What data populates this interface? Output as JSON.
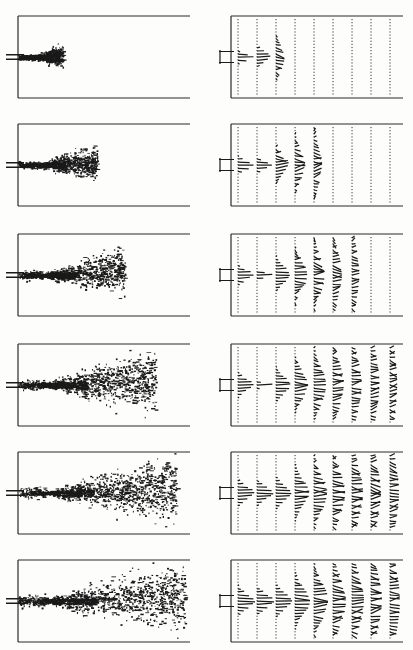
{
  "figure": {
    "panel_columns": [
      "flow-visualization",
      "velocity-vector-field"
    ],
    "row_count": 6,
    "colors": {
      "ink": "#1a1a1a",
      "frame": "#2b2b2b",
      "background": "#ffffff",
      "vector_dot": "#4a4a4a"
    }
  },
  "layout": {
    "image_width": 413,
    "image_height": 650,
    "left_panel": {
      "x": 18,
      "width": 172,
      "height": 82
    },
    "right_panel": {
      "x": 231,
      "width": 172,
      "height": 82
    },
    "row_tops": [
      16,
      124,
      234,
      344,
      452,
      560
    ],
    "row_height": 82,
    "vector_columns": 9,
    "vector_column_spacing": 19,
    "nozzle_axis_fraction": 0.5
  },
  "chart_data": {
    "type": "scatter",
    "xlabel": "streamwise distance x/D",
    "ylabel": "transverse distance y/D",
    "grid": false,
    "legend": null,
    "xlim": [
      0,
      10
    ],
    "ylim": [
      -2.5,
      2.5
    ],
    "stations_x": [
      0.4,
      1.5,
      2.6,
      3.7,
      4.8,
      5.9,
      7.0,
      8.1,
      9.2
    ],
    "series": [
      {
        "name": "stage-1",
        "row": 1,
        "penetration_fraction": 0.26,
        "spread_half_width": 0.16,
        "active_vector_columns": 3,
        "particle_density": 0.55,
        "core_length_fraction": 0.1,
        "vector_peak_magnitude": 1.0
      },
      {
        "name": "stage-2",
        "row": 2,
        "penetration_fraction": 0.46,
        "spread_half_width": 0.26,
        "active_vector_columns": 5,
        "particle_density": 0.62,
        "core_length_fraction": 0.12,
        "vector_peak_magnitude": 1.0
      },
      {
        "name": "stage-3",
        "row": 3,
        "penetration_fraction": 0.62,
        "spread_half_width": 0.34,
        "active_vector_columns": 7,
        "particle_density": 0.7,
        "core_length_fraction": 0.14,
        "vector_peak_magnitude": 1.0
      },
      {
        "name": "stage-4",
        "row": 4,
        "penetration_fraction": 0.8,
        "spread_half_width": 0.46,
        "active_vector_columns": 9,
        "particle_density": 0.8,
        "core_length_fraction": 0.15,
        "vector_peak_magnitude": 1.0
      },
      {
        "name": "stage-5",
        "row": 5,
        "penetration_fraction": 0.92,
        "spread_half_width": 0.52,
        "active_vector_columns": 9,
        "particle_density": 0.85,
        "core_length_fraction": 0.16,
        "vector_peak_magnitude": 1.05
      },
      {
        "name": "stage-6",
        "row": 6,
        "penetration_fraction": 0.97,
        "spread_half_width": 0.56,
        "active_vector_columns": 9,
        "particle_density": 0.88,
        "core_length_fraction": 0.16,
        "vector_peak_magnitude": 1.1
      }
    ]
  }
}
